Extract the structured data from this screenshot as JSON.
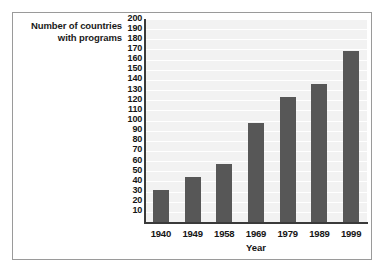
{
  "chart_data": {
    "type": "bar",
    "title": "",
    "xlabel": "Year",
    "ylabel": "Number of countries with programs",
    "ylabel_lines": [
      "Number of countries",
      "with programs"
    ],
    "categories": [
      "1940",
      "1949",
      "1958",
      "1969",
      "1979",
      "1989",
      "1999"
    ],
    "values": [
      32,
      44,
      57,
      98,
      123,
      136,
      168
    ],
    "series": [
      {
        "name": "Number of countries with programs",
        "values": [
          32,
          44,
          57,
          98,
          123,
          136,
          168
        ]
      }
    ],
    "ylim": [
      0,
      200
    ],
    "ytick_values": [
      200,
      190,
      180,
      170,
      160,
      150,
      140,
      130,
      120,
      110,
      100,
      90,
      80,
      70,
      60,
      50,
      40,
      30,
      20,
      10
    ],
    "ytick_labels": [
      "200",
      "190",
      "180",
      "170",
      "160",
      "150",
      "140",
      "130",
      "120",
      "110",
      "100",
      "90",
      "80",
      "70",
      "60",
      "50",
      "40",
      "30",
      "20",
      "10"
    ],
    "ytick_step": 10,
    "grid": true,
    "grid_orientation": "horizontal",
    "legend": false,
    "legend_position": "none",
    "colors": {
      "bar": "#575757",
      "plot_background": "#f2f2f2",
      "gridline": "#ffffff",
      "axis": "#3a3a3a",
      "text": "#151515",
      "frame_border": "#9a9a9a",
      "figure_background": "#ffffff"
    }
  }
}
